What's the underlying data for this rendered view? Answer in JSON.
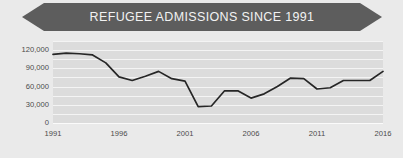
{
  "banner": {
    "title": "REFUGEE ADMISSIONS SINCE 1991"
  },
  "colors": {
    "banner_fill": "#5d5d5d",
    "banner_text": "#f2f2f2",
    "plot_background": "#dcdcdc",
    "page_background": "#eaeaea",
    "gridline": "#f4f4f4",
    "line": "#262626",
    "tick_text": "#4a4a4a"
  },
  "chart_data": {
    "type": "line",
    "title": "REFUGEE ADMISSIONS SINCE 1991",
    "xlabel": "",
    "ylabel": "",
    "grid": true,
    "legend": "none",
    "xlim": [
      1991,
      2016
    ],
    "ylim": [
      0,
      135000
    ],
    "ytick_labels": [
      "120,000",
      "90,000",
      "60,000",
      "30,000",
      "0"
    ],
    "ytick_values": [
      120000,
      90000,
      60000,
      30000,
      0
    ],
    "gridline_values": [
      135000,
      120000,
      105000,
      90000,
      75000,
      60000,
      45000,
      30000,
      15000
    ],
    "xtick_labels": [
      "1991",
      "1996",
      "2001",
      "2006",
      "2011",
      "2016"
    ],
    "xtick_values": [
      1991,
      1996,
      2001,
      2006,
      2011,
      2016
    ],
    "x": [
      1991,
      1992,
      1993,
      1994,
      1995,
      1996,
      1997,
      1998,
      1999,
      2000,
      2001,
      2002,
      2003,
      2004,
      2005,
      2006,
      2007,
      2008,
      2009,
      2010,
      2011,
      2012,
      2013,
      2014,
      2015,
      2016
    ],
    "series": [
      {
        "name": "Refugee admissions",
        "values": [
          113000,
          115000,
          114000,
          112000,
          99000,
          76000,
          70000,
          77000,
          85000,
          73000,
          69000,
          27000,
          28000,
          53000,
          53000,
          41000,
          48000,
          60000,
          74000,
          73000,
          56000,
          58000,
          70000,
          70000,
          70000,
          85000
        ]
      }
    ]
  }
}
